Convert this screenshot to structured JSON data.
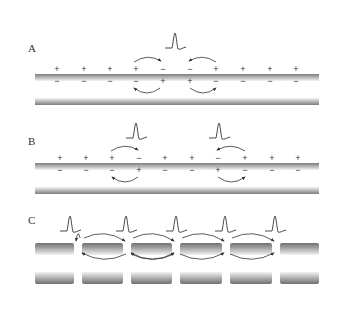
{
  "figure": {
    "panels": [
      {
        "id": "A",
        "label": "A",
        "description": "Continuous conduction, single action potential",
        "outside_charges": [
          "+",
          "+",
          "+",
          "+",
          "−",
          "−",
          "+",
          "+",
          "+",
          "+"
        ],
        "inside_charges": [
          "−",
          "−",
          "−",
          "−",
          "+",
          "+",
          "−",
          "−",
          "−",
          "−"
        ],
        "charge_x": [
          57,
          84,
          110,
          136,
          163,
          190,
          216,
          243,
          270,
          296
        ],
        "spikes": [
          {
            "x": 175
          }
        ],
        "membrane_top_y": 78,
        "membrane_bottom_y": 101
      },
      {
        "id": "B",
        "label": "B",
        "description": "Continuous conduction, two action potentials propagating outward",
        "outside_charges": [
          "+",
          "+",
          "+",
          "−",
          "+",
          "+",
          "−",
          "+",
          "+",
          "+"
        ],
        "inside_charges": [
          "−",
          "−",
          "−",
          "+",
          "−",
          "−",
          "+",
          "−",
          "−",
          "−"
        ],
        "charge_x": [
          60,
          86,
          112,
          139,
          165,
          192,
          218,
          245,
          272,
          298
        ],
        "spikes": [
          {
            "x": 136
          },
          {
            "x": 219
          }
        ],
        "membrane_top_y": 167,
        "membrane_bottom_y": 190
      },
      {
        "id": "C",
        "label": "C",
        "description": "Saltatory conduction along myelinated axon with nodes of Ranvier",
        "node_x": [
          78,
          127,
          176,
          226,
          276
        ],
        "spikes": [
          {
            "x": 70
          },
          {
            "x": 126
          },
          {
            "x": 176
          },
          {
            "x": 225
          },
          {
            "x": 275
          }
        ],
        "membrane_top_y": 251,
        "membrane_bottom_y": 275
      }
    ],
    "colors": {
      "membrane_dark": "#7a7a7a",
      "membrane_light": "#f2f2f2",
      "line": "#333333",
      "background": "#ffffff"
    }
  }
}
